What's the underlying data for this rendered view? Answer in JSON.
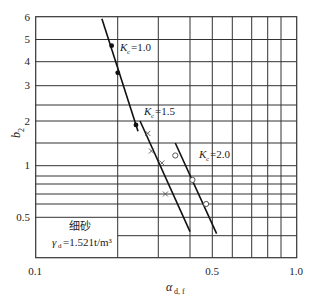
{
  "chart_data": {
    "type": "scatter",
    "title": "",
    "xlabel": "α_d,f",
    "xlabel_main": "α",
    "xlabel_sub": "d, f",
    "ylabel": "b₂",
    "ylabel_main": "b",
    "ylabel_sub": "2",
    "xscale": "log",
    "yscale": "log",
    "xlim": [
      0.1,
      1.0
    ],
    "ylim": [
      0.35,
      6
    ],
    "x_tick_labels": [
      "0.1",
      "0.5",
      "1.0"
    ],
    "y_tick_labels": [
      "6",
      "5",
      "4",
      "3",
      "2",
      "1",
      "0.5"
    ],
    "grid": true,
    "annotation": {
      "material": "细砂",
      "density_label": "γ",
      "density_sub": "d",
      "density_value": "=1.521t/m³"
    },
    "series": [
      {
        "name": "K_c=1.0",
        "label_main": "K",
        "label_sub": "c",
        "label_value": "=1.0",
        "marker": "filled-circle",
        "points": [
          [
            0.19,
            4.7
          ],
          [
            0.2,
            3.5
          ],
          [
            0.24,
            1.9
          ]
        ],
        "fit_line": [
          [
            0.175,
            5.9
          ],
          [
            0.245,
            1.75
          ]
        ]
      },
      {
        "name": "K_c=1.5",
        "label_main": "K",
        "label_sub": "c",
        "label_value": "=1.5",
        "marker": "cross",
        "points": [
          [
            0.27,
            1.7
          ],
          [
            0.28,
            1.3
          ],
          [
            0.31,
            1.05
          ],
          [
            0.32,
            0.7
          ]
        ],
        "fit_line": [
          [
            0.25,
            2.0
          ],
          [
            0.4,
            0.42
          ]
        ]
      },
      {
        "name": "K_c=2.0",
        "label_main": "K",
        "label_sub": "c",
        "label_value": "=2.0",
        "marker": "open-circle",
        "points": [
          [
            0.35,
            1.2
          ],
          [
            0.41,
            0.85
          ],
          [
            0.47,
            0.6
          ]
        ],
        "fit_line": [
          [
            0.35,
            1.5
          ],
          [
            0.52,
            0.41
          ]
        ]
      }
    ]
  }
}
